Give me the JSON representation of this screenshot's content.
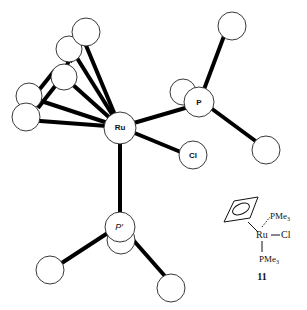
{
  "figure": {
    "labels": {
      "ru": "Ru",
      "p": "P",
      "cl": "Cl",
      "p_prime": "P′"
    },
    "inset": {
      "pme3_top": "PMe",
      "pme3_top_sub": "3",
      "ru": "Ru",
      "cl": "Cl",
      "pme3_bottom": "PMe",
      "pme3_bottom_sub": "3",
      "compound_number": "11"
    }
  }
}
